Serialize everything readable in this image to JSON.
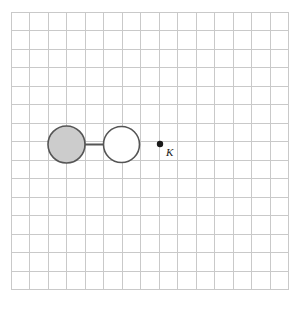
{
  "figure": {
    "background_color": "#ffffff",
    "width": 302,
    "height": 309
  },
  "grid": {
    "name": "square-grid",
    "origin_x": 11,
    "origin_y": 12,
    "cell_size": 18.5,
    "columns": 15,
    "rows": 15,
    "line_color": "#c9c9c9",
    "line_width": 1
  },
  "shapes": {
    "filled_circle": {
      "name": "gray-circle",
      "center_x": 66.5,
      "center_y": 144.5,
      "radius": 18.5,
      "fill": "#cccccc",
      "stroke": "#555555",
      "stroke_width": 1.6
    },
    "open_circle": {
      "name": "white-circle",
      "center_x": 121.5,
      "center_y": 144.5,
      "radius": 18,
      "fill": "#ffffff",
      "stroke": "#555555",
      "stroke_width": 1.6
    },
    "connector": {
      "name": "connecting-bar",
      "x1": 58,
      "y1": 144.5,
      "x2": 140,
      "y2": 144.5,
      "stroke": "#555555",
      "stroke_width": 2
    },
    "point": {
      "name": "point-k",
      "center_x": 160,
      "center_y": 144,
      "radius": 3.2,
      "fill": "#1a1a1a",
      "label": "K",
      "label_x": 166,
      "label_y": 156,
      "label_size": 11,
      "label_color": "#1a1a1a"
    }
  }
}
